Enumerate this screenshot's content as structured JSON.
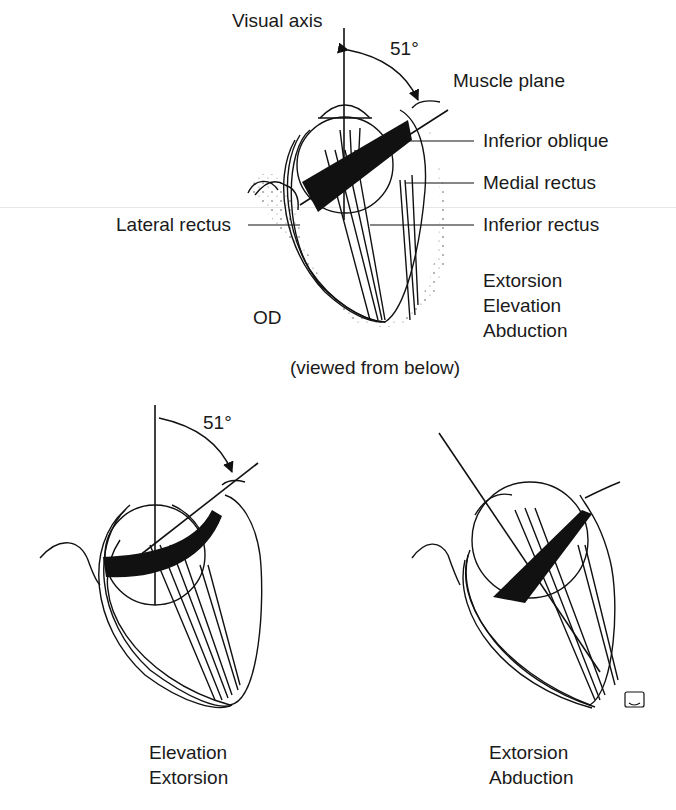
{
  "top_figure": {
    "eye": "OD",
    "angle_label": "51°",
    "labels": {
      "visual_axis": "Visual axis",
      "muscle_plane": "Muscle plane",
      "inferior_oblique": "Inferior oblique",
      "medial_rectus": "Medial rectus",
      "lateral_rectus": "Lateral rectus",
      "inferior_rectus": "Inferior rectus"
    },
    "actions": [
      "Extorsion",
      "Elevation",
      "Abduction"
    ],
    "caption": "(viewed from below)"
  },
  "bottom_left_figure": {
    "angle_label": "51°",
    "actions": [
      "Elevation",
      "Extorsion"
    ]
  },
  "bottom_right_figure": {
    "actions": [
      "Extorsion",
      "Abduction"
    ]
  },
  "signature": "RB"
}
